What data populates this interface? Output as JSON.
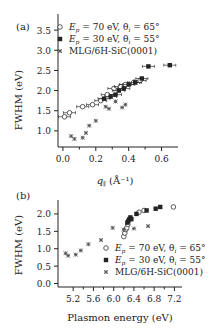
{
  "chart_data": [
    {
      "type": "scatter",
      "panel_label": "(a)",
      "xlabel": "q∥ (Å⁻¹)",
      "ylabel": "FWHM (eV)",
      "xlim": [
        -0.03,
        0.7
      ],
      "ylim": [
        0.6,
        3.9
      ],
      "xticks": [
        "0.0",
        "0.2",
        "0.4",
        "0.6"
      ],
      "xtick_values": [
        0.0,
        0.2,
        0.4,
        0.6
      ],
      "yticks": [
        "1.0",
        "1.5",
        "2.0",
        "2.5",
        "3.0",
        "3.5"
      ],
      "ytick_values": [
        1.0,
        1.5,
        2.0,
        2.5,
        3.0,
        3.5
      ],
      "legend": [
        "E_p = 70 eV, θ_i = 65°",
        "E_p = 30 eV, θ_i = 55°",
        "MLG/6H-SiC(0001)"
      ],
      "legend_position": "top-left",
      "series": [
        {
          "name": "E_p = 70 eV, θ_i = 65°",
          "marker": "open-circle",
          "x": [
            0.01,
            0.04,
            0.12,
            0.18,
            0.23,
            0.27,
            0.31,
            0.35,
            0.38,
            0.43,
            0.47
          ],
          "y": [
            1.35,
            1.45,
            1.6,
            1.65,
            1.75,
            1.9,
            2.05,
            2.1,
            2.15,
            2.2,
            2.25
          ]
        },
        {
          "name": "E_p = 30 eV, θ_i = 55°",
          "marker": "filled-square",
          "x": [
            0.25,
            0.29,
            0.32,
            0.34,
            0.37,
            0.4,
            0.44,
            0.48,
            0.52,
            0.65
          ],
          "y": [
            1.8,
            1.85,
            1.9,
            2.0,
            2.05,
            2.15,
            2.2,
            2.3,
            2.6,
            2.63
          ]
        },
        {
          "name": "MLG/6H-SiC(0001)",
          "marker": "asterisk",
          "x": [
            0.05,
            0.07,
            0.12,
            0.14,
            0.16,
            0.2,
            0.26,
            0.28,
            0.32,
            0.36,
            0.38
          ],
          "y": [
            0.87,
            0.8,
            0.83,
            0.95,
            1.13,
            1.25,
            1.6,
            1.55,
            1.73,
            1.58,
            1.65
          ]
        }
      ]
    },
    {
      "type": "scatter",
      "panel_label": "(b)",
      "xlabel": "Plasmon energy (eV)",
      "ylabel": "FWHM (eV)",
      "xlim": [
        4.9,
        7.35
      ],
      "ylim": [
        -0.1,
        2.4
      ],
      "xticks": [
        "5.2",
        "5.6",
        "6.0",
        "6.4",
        "6.8",
        "7.2"
      ],
      "xtick_values": [
        5.2,
        5.6,
        6.0,
        6.4,
        6.8,
        7.2
      ],
      "yticks": [
        "0.0",
        "0.5",
        "1.0",
        "1.5",
        "2.0"
      ],
      "ytick_values": [
        0.0,
        0.5,
        1.0,
        1.5,
        2.0
      ],
      "legend": [
        "E_p = 70 eV, θ_i = 65°",
        "E_p = 30 eV, θ_i = 55°",
        "MLG/6H-SiC(0001)"
      ],
      "legend_position": "bottom-right",
      "series": [
        {
          "name": "E_p = 70 eV, θ_i = 65°",
          "marker": "open-circle",
          "x": [
            6.2,
            6.22,
            6.24,
            6.26,
            6.28,
            6.5,
            6.6,
            7.18
          ],
          "y": [
            1.35,
            1.45,
            1.55,
            1.6,
            1.7,
            2.05,
            2.1,
            2.2
          ]
        },
        {
          "name": "E_p = 30 eV, θ_i = 55°",
          "marker": "filled-square",
          "x": [
            6.27,
            6.29,
            6.31,
            6.33,
            6.35,
            6.45,
            6.65,
            6.83,
            6.92
          ],
          "y": [
            1.75,
            1.8,
            1.85,
            1.9,
            1.85,
            2.0,
            2.1,
            2.15,
            2.2
          ]
        },
        {
          "name": "MLG/6H-SiC(0001)",
          "marker": "asterisk",
          "x": [
            5.05,
            5.1,
            5.25,
            5.35,
            5.5,
            5.75,
            5.98,
            6.2,
            6.4,
            6.68
          ],
          "y": [
            0.87,
            0.8,
            0.83,
            0.95,
            1.13,
            1.25,
            1.6,
            1.55,
            1.58,
            1.65
          ]
        }
      ]
    }
  ]
}
